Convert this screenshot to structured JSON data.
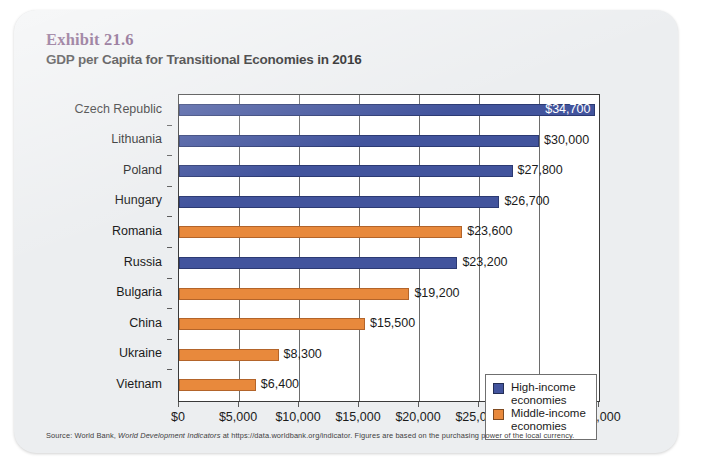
{
  "exhibit": {
    "number": "Exhibit 21.6",
    "title": "GDP per Capita for Transitional Economies in 2016",
    "source_prefix": "Source: World Bank, ",
    "source_italic": "World Development Indicators",
    "source_suffix": " at https://data.worldbank.org/indicator. Figures are based on the purchasing power of the local currency."
  },
  "legend": {
    "items": [
      {
        "label_line1": "High-income",
        "label_line2": "economies",
        "color": "#42549d",
        "key": "high"
      },
      {
        "label_line1": "Middle-income",
        "label_line2": "economies",
        "color": "#e8893c",
        "key": "middle"
      }
    ]
  },
  "chart_data": {
    "type": "bar",
    "orientation": "horizontal",
    "title": "GDP per Capita for Transitional Economies in 2016",
    "xlabel": "",
    "ylabel": "",
    "xlim": [
      0,
      35000
    ],
    "grid": true,
    "legend_position": "inside-bottom-right",
    "xticks": [
      0,
      5000,
      10000,
      15000,
      20000,
      25000,
      30000,
      35000
    ],
    "xtick_labels": [
      "$0",
      "$5,000",
      "$10,000",
      "$15,000",
      "$20,000",
      "$25,000",
      "$30,000",
      "$35,000"
    ],
    "categories": [
      "Czech Republic",
      "Lithuania",
      "Poland",
      "Hungary",
      "Romania",
      "Russia",
      "Bulgaria",
      "China",
      "Ukraine",
      "Vietnam"
    ],
    "values": [
      34700,
      30000,
      27800,
      26700,
      23600,
      23200,
      19200,
      15500,
      8300,
      6400
    ],
    "data_labels": [
      "$34,700",
      "$30,000",
      "$27,800",
      "$26,700",
      "$23,600",
      "$23,200",
      "$19,200",
      "$15,500",
      "$8,300",
      "$6,400"
    ],
    "groups": [
      "high",
      "high",
      "high",
      "high",
      "middle",
      "high",
      "middle",
      "middle",
      "middle",
      "middle"
    ],
    "label_placement": [
      "inside",
      "outside",
      "outside",
      "outside",
      "outside",
      "outside",
      "outside",
      "outside",
      "outside",
      "outside"
    ],
    "series": [
      {
        "name": "High-income economies",
        "color": "#42549d"
      },
      {
        "name": "Middle-income economies",
        "color": "#e8893c"
      }
    ]
  }
}
